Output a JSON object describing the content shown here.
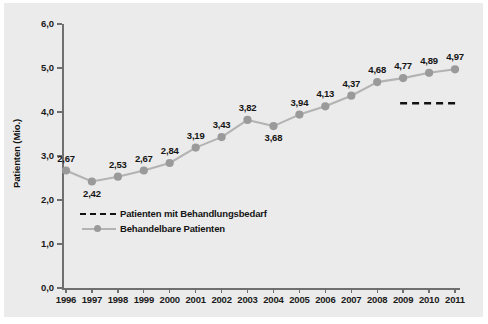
{
  "chart_data": {
    "type": "line",
    "title": "",
    "xlabel": "",
    "ylabel": "Patienten (Mio.)",
    "categories": [
      "1996",
      "1997",
      "1998",
      "1999",
      "2000",
      "2001",
      "2002",
      "2003",
      "2004",
      "2005",
      "2006",
      "2007",
      "2008",
      "2009",
      "2010",
      "2011"
    ],
    "ylim": [
      0.0,
      6.0
    ],
    "yticks": [
      "0,0",
      "1,0",
      "2,0",
      "3,0",
      "4,0",
      "5,0",
      "6,0"
    ],
    "ytick_values": [
      0.0,
      1.0,
      2.0,
      3.0,
      4.0,
      5.0,
      6.0
    ],
    "grid": false,
    "legend_position": "inside-lower-left",
    "series": [
      {
        "name": "Patienten mit Behandlungsbedarf",
        "style": "dashed",
        "color": "#111111",
        "x": [
          "2009",
          "2010",
          "2011"
        ],
        "values": [
          4.2,
          4.2,
          4.2
        ],
        "note": "kurzes waagerechtes gestricheltes Segment rechts bei ca. 4,2 Mio."
      },
      {
        "name": "Behandelbare Patienten",
        "style": "solid-with-markers",
        "color": "#b3b3b3",
        "marker_color": "#9a9a9a",
        "values": [
          2.67,
          2.42,
          2.53,
          2.67,
          2.84,
          3.19,
          3.43,
          3.82,
          3.68,
          3.94,
          4.13,
          4.37,
          4.68,
          4.77,
          4.89,
          4.97
        ],
        "labels": [
          "2,67",
          "2,42",
          "2,53",
          "2,67",
          "2,84",
          "3,19",
          "3,43",
          "3,82",
          "3,68",
          "3,94",
          "4,13",
          "4,37",
          "4,68",
          "4,77",
          "4,89",
          "4,97"
        ],
        "label_positions": [
          "above",
          "below",
          "above",
          "above",
          "above",
          "above",
          "above",
          "above",
          "below",
          "above",
          "above",
          "above",
          "above",
          "above",
          "above",
          "above"
        ]
      }
    ]
  },
  "legend": {
    "items": [
      {
        "label": "Patienten mit Behandlungsbedarf",
        "key": "dashed-line-key"
      },
      {
        "label": "Behandelbare Patienten",
        "key": "line-marker-key"
      }
    ]
  },
  "colors": {
    "panel_background": "#ebebeb",
    "axis": "#6f6f6f",
    "series_line": "#b3b3b3",
    "series_marker": "#9a9a9a",
    "dashed_series": "#111111",
    "text": "#141414"
  }
}
